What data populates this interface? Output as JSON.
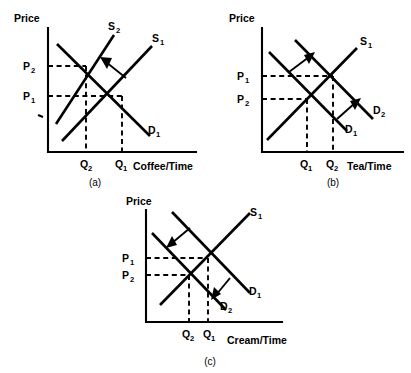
{
  "figure": {
    "type": "supply-demand-diagram-set",
    "background": "#ffffff",
    "ink_color": "#000000",
    "panel_count": 3
  },
  "panels": [
    {
      "id": "a",
      "caption": "(a)",
      "y_axis_label": "Price",
      "x_axis_label": "Coffee/Time",
      "shift": "supply shifts left (decrease in supply)",
      "arrow_direction": "up-left",
      "curves": [
        {
          "name": "S1",
          "label": "S",
          "sub": "1",
          "kind": "supply",
          "position": "right"
        },
        {
          "name": "S2",
          "label": "S",
          "sub": "2",
          "kind": "supply",
          "position": "left"
        },
        {
          "name": "D1",
          "label": "D",
          "sub": "1",
          "kind": "demand",
          "position": "only"
        }
      ],
      "price_ticks": [
        {
          "label": "P",
          "sub": "2",
          "rank": "upper"
        },
        {
          "label": "P",
          "sub": "1",
          "rank": "lower"
        }
      ],
      "quantity_ticks": [
        {
          "label": "Q",
          "sub": "2",
          "rank": "left"
        },
        {
          "label": "Q",
          "sub": "1",
          "rank": "right"
        }
      ]
    },
    {
      "id": "b",
      "caption": "(b)",
      "y_axis_label": "Price",
      "x_axis_label": "Tea/Time",
      "shift": "demand shifts right (increase in demand)",
      "arrow_direction": "up-right",
      "curves": [
        {
          "name": "S1",
          "label": "S",
          "sub": "1",
          "kind": "supply",
          "position": "only"
        },
        {
          "name": "D1",
          "label": "D",
          "sub": "1",
          "kind": "demand",
          "position": "left"
        },
        {
          "name": "D2",
          "label": "D",
          "sub": "2",
          "kind": "demand",
          "position": "right"
        }
      ],
      "price_ticks": [
        {
          "label": "P",
          "sub": "1",
          "rank": "upper"
        },
        {
          "label": "P",
          "sub": "2",
          "rank": "lower"
        }
      ],
      "quantity_ticks": [
        {
          "label": "Q",
          "sub": "1",
          "rank": "left"
        },
        {
          "label": "Q",
          "sub": "2",
          "rank": "right"
        }
      ]
    },
    {
      "id": "c",
      "caption": "(c)",
      "y_axis_label": "Price",
      "x_axis_label": "Cream/Time",
      "shift": "demand shifts left (decrease in demand)",
      "arrow_direction": "down-left",
      "curves": [
        {
          "name": "S1",
          "label": "S",
          "sub": "1",
          "kind": "supply",
          "position": "only"
        },
        {
          "name": "D1",
          "label": "D",
          "sub": "1",
          "kind": "demand",
          "position": "right"
        },
        {
          "name": "D2",
          "label": "D",
          "sub": "2",
          "kind": "demand",
          "position": "left"
        }
      ],
      "price_ticks": [
        {
          "label": "P",
          "sub": "1",
          "rank": "upper"
        },
        {
          "label": "P",
          "sub": "2",
          "rank": "lower"
        }
      ],
      "quantity_ticks": [
        {
          "label": "Q",
          "sub": "2",
          "rank": "left"
        },
        {
          "label": "Q",
          "sub": "1",
          "rank": "right"
        }
      ]
    }
  ]
}
